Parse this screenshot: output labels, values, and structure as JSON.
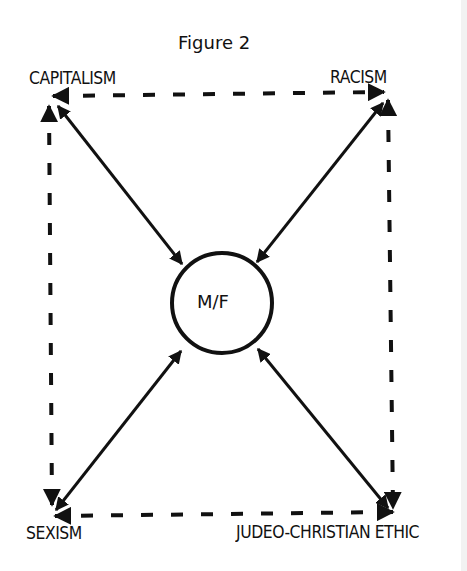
{
  "figure": {
    "title": "Figure 2",
    "center_node": "M/F",
    "corners": {
      "top_left": "CAPITALISM",
      "top_right": "RACISM",
      "bottom_left": "SEXISM",
      "bottom_right": "JUDEO-CHRISTIAN  ETHIC"
    },
    "edges": [
      {
        "from": "CAPITALISM",
        "to": "RACISM",
        "style": "dashed",
        "arrows": "both"
      },
      {
        "from": "RACISM",
        "to": "JUDEO-CHRISTIAN ETHIC",
        "style": "dashed",
        "arrows": "both"
      },
      {
        "from": "JUDEO-CHRISTIAN ETHIC",
        "to": "SEXISM",
        "style": "dashed",
        "arrows": "both"
      },
      {
        "from": "SEXISM",
        "to": "CAPITALISM",
        "style": "dashed",
        "arrows": "both"
      },
      {
        "from": "CAPITALISM",
        "to": "M/F",
        "style": "solid",
        "arrows": "both"
      },
      {
        "from": "RACISM",
        "to": "M/F",
        "style": "solid",
        "arrows": "both"
      },
      {
        "from": "SEXISM",
        "to": "M/F",
        "style": "solid",
        "arrows": "both"
      },
      {
        "from": "JUDEO-CHRISTIAN ETHIC",
        "to": "M/F",
        "style": "solid",
        "arrows": "both"
      }
    ],
    "line_color": "#111111"
  }
}
